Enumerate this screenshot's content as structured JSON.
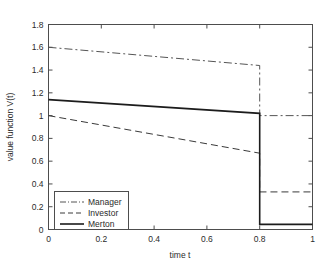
{
  "figure": {
    "background_color": "#ffffff",
    "axis_color": "#4d4d4d",
    "text_color": "#2b2b2b"
  },
  "chart_data": {
    "type": "line",
    "title": "",
    "xlabel": "time t",
    "ylabel": "value function V(t)",
    "xlim": [
      0,
      1
    ],
    "ylim": [
      0,
      1.8
    ],
    "xticks": [
      0,
      0.2,
      0.4,
      0.6,
      0.8,
      1
    ],
    "xtick_labels": [
      "0",
      "0.2",
      "0.4",
      "0.6",
      "0.8",
      "1"
    ],
    "yticks": [
      0,
      0.2,
      0.4,
      0.6,
      0.8,
      1,
      1.2,
      1.4,
      1.6,
      1.8
    ],
    "ytick_labels": [
      "0",
      "0.2",
      "0.4",
      "0.6",
      "0.8",
      "1",
      "1.2",
      "1.4",
      "1.6",
      "1.8"
    ],
    "grid": false,
    "legend_position": "lower left",
    "jump_time": 0.8,
    "series": [
      {
        "name": "Manager",
        "linestyle": "dashdot",
        "color": "#555555",
        "linewidth": 1.0,
        "x": [
          0,
          0.8,
          0.8,
          1
        ],
        "values": [
          1.6,
          1.44,
          1.0,
          1.0
        ],
        "start_value": 1.6,
        "pre_jump_value": 1.44,
        "post_jump_value": 1.0,
        "end_value": 1.0
      },
      {
        "name": "Investor",
        "linestyle": "dashed",
        "color": "#3a3a3a",
        "linewidth": 1.0,
        "x": [
          0,
          0.8,
          0.8,
          1
        ],
        "values": [
          1.0,
          0.67,
          0.33,
          0.33
        ],
        "start_value": 1.0,
        "pre_jump_value": 0.67,
        "post_jump_value": 0.33,
        "end_value": 0.33
      },
      {
        "name": "Merton",
        "linestyle": "solid",
        "color": "#1c1c1c",
        "linewidth": 1.6,
        "x": [
          0,
          0.8,
          0.8,
          1
        ],
        "values": [
          1.14,
          1.02,
          0.045,
          0.045
        ],
        "start_value": 1.14,
        "pre_jump_value": 1.02,
        "post_jump_value": 0.045,
        "end_value": 0.045
      }
    ],
    "legend_entries": [
      "Manager",
      "Investor",
      "Merton"
    ]
  }
}
